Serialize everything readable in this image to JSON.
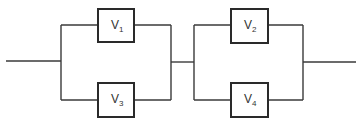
{
  "diagram": {
    "type": "series-parallel block diagram",
    "colors": {
      "line": "#3a3a3a",
      "box_border": "#2a2a2a",
      "background": "#ffffff",
      "text": "#333333"
    },
    "blocks": [
      {
        "id": "v1",
        "label": "V",
        "subscript": "1",
        "group": "parallel-1",
        "position": "top"
      },
      {
        "id": "v3",
        "label": "V",
        "subscript": "3",
        "group": "parallel-1",
        "position": "bottom"
      },
      {
        "id": "v2",
        "label": "V",
        "subscript": "2",
        "group": "parallel-2",
        "position": "top"
      },
      {
        "id": "v4",
        "label": "V",
        "subscript": "4",
        "group": "parallel-2",
        "position": "bottom"
      }
    ],
    "structure": "input -> (V1 || V3) -> (V2 || V4) -> output"
  }
}
